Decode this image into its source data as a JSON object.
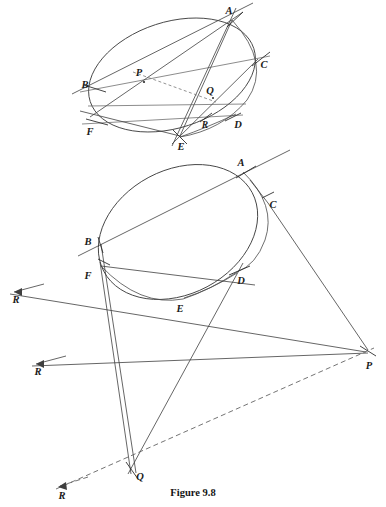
{
  "figure": {
    "caption": "Figure 9.8",
    "caption_position": {
      "x": 193,
      "y": 494
    },
    "background_color": "#ffffff",
    "ink_color": "#3d3d3d",
    "label_color": "#1a1a1a",
    "width": 386,
    "height": 507
  },
  "upper_figure": {
    "name": "upper-construction",
    "conic": {
      "type": "ellipse",
      "center": {
        "x": 172,
        "y": 75
      },
      "rx": 86,
      "ry": 53,
      "rotation_deg": -18
    },
    "points": [
      {
        "label": "A",
        "x": 232,
        "y": 20,
        "label_x": 229,
        "label_y": 14
      },
      {
        "label": "B",
        "x": 96,
        "y": 88,
        "label_x": 85,
        "label_y": 88
      },
      {
        "label": "C",
        "x": 258,
        "y": 59,
        "label_x": 262,
        "label_y": 66
      },
      {
        "label": "D",
        "x": 233,
        "y": 117,
        "label_x": 236,
        "label_y": 126
      },
      {
        "label": "E",
        "x": 180,
        "y": 136,
        "label_x": 180,
        "label_y": 148
      },
      {
        "label": "F",
        "x": 97,
        "y": 122,
        "label_x": 89,
        "label_y": 133
      },
      {
        "label": "P",
        "x": 144,
        "y": 82,
        "label_x": 138,
        "label_y": 76
      },
      {
        "label": "Q",
        "x": 213,
        "y": 98,
        "label_x": 209,
        "label_y": 94
      },
      {
        "label": "R",
        "x": 206,
        "y": 117,
        "label_x": 203,
        "label_y": 126
      }
    ]
  },
  "lower_figure": {
    "name": "lower-construction",
    "conic_outer": {
      "type": "ellipse",
      "center": {
        "x": 178,
        "y": 232
      },
      "rx": 84,
      "ry": 62,
      "rotation_deg": -28
    },
    "conic_inner": {
      "type": "arc",
      "description": "second conic arc through A, C, D, E, F"
    },
    "points": [
      {
        "label": "A",
        "x": 243,
        "y": 172,
        "label_x": 241,
        "label_y": 165
      },
      {
        "label": "B",
        "x": 101,
        "y": 244,
        "label_x": 88,
        "label_y": 242
      },
      {
        "label": "C",
        "x": 268,
        "y": 203,
        "label_x": 271,
        "label_y": 206
      },
      {
        "label": "D",
        "x": 237,
        "y": 272,
        "label_x": 238,
        "label_y": 281
      },
      {
        "label": "E",
        "x": 183,
        "y": 299,
        "label_x": 179,
        "label_y": 310
      },
      {
        "label": "F",
        "x": 101,
        "y": 266,
        "label_x": 88,
        "label_y": 278
      },
      {
        "label": "P",
        "x": 366,
        "y": 352,
        "label_x": 366,
        "label_y": 366
      },
      {
        "label": "Q",
        "x": 133,
        "y": 470,
        "label_x": 137,
        "label_y": 478
      }
    ],
    "axis_labels": [
      {
        "label": "R",
        "x": 16,
        "y": 300,
        "arrow_from": {
          "x": 44,
          "y": 284
        },
        "arrow_to": {
          "x": 10,
          "y": 294
        }
      },
      {
        "label": "R",
        "x": 39,
        "y": 372,
        "arrow_from": {
          "x": 66,
          "y": 356
        },
        "arrow_to": {
          "x": 32,
          "y": 366
        }
      },
      {
        "label": "R",
        "x": 62,
        "y": 495,
        "arrow_from": {
          "x": 90,
          "y": 477
        },
        "arrow_to": {
          "x": 56,
          "y": 489
        }
      }
    ]
  },
  "labels": {
    "A": "A",
    "B": "B",
    "C": "C",
    "D": "D",
    "E": "E",
    "F": "F",
    "P": "P",
    "Q": "Q",
    "R": "R"
  }
}
